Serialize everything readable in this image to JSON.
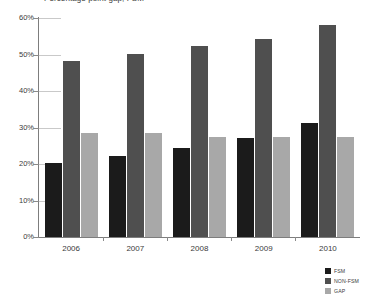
{
  "chart_data": {
    "type": "bar",
    "title": "Percentage point gap, FSM",
    "categories": [
      "2006",
      "2007",
      "2008",
      "2009",
      "2010"
    ],
    "series": [
      {
        "name": "FSM",
        "color": "#1b1b1b",
        "values": [
          20.3,
          22.3,
          24.5,
          27.2,
          31.2
        ]
      },
      {
        "name": "NON-FSM",
        "color": "#4f4f4f",
        "values": [
          48.2,
          50.2,
          52.2,
          54.2,
          58.2
        ]
      },
      {
        "name": "GAP",
        "color": "#a8a8a8",
        "values": [
          28.5,
          28.5,
          27.5,
          27.5,
          27.5
        ]
      }
    ],
    "xlabel": "",
    "ylabel": "",
    "ylim": [
      0,
      60
    ],
    "yticks": [
      {
        "value": 60,
        "label": "60%"
      },
      {
        "value": 50,
        "label": "50%"
      },
      {
        "value": 40,
        "label": "40%"
      },
      {
        "value": 30,
        "label": "30%"
      },
      {
        "value": 20,
        "label": "20%"
      },
      {
        "value": 10,
        "label": "10%"
      },
      {
        "value": 0,
        "label": "0%"
      }
    ],
    "grid": true,
    "legend_position": "bottom-right"
  }
}
